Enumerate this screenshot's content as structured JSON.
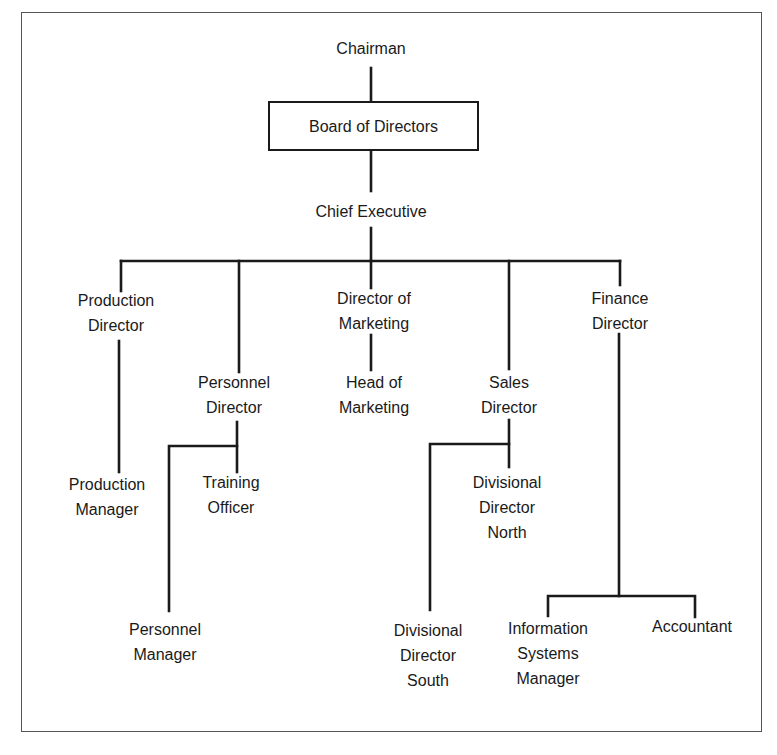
{
  "nodes": [
    {
      "id": "chairman",
      "lines": [
        "Chairman"
      ],
      "x": 371,
      "y": 36
    },
    {
      "id": "board",
      "lines": [
        "Board of Directors"
      ],
      "boxed": true,
      "x": 268,
      "y": 101,
      "w": 211,
      "h": 50
    },
    {
      "id": "chief_exec",
      "lines": [
        "Chief Executive"
      ],
      "x": 371,
      "y": 199
    },
    {
      "id": "production_director",
      "lines": [
        "Production",
        "Director"
      ],
      "x": 116,
      "y": 288
    },
    {
      "id": "personnel_director",
      "lines": [
        "Personnel",
        "Director"
      ],
      "x": 234,
      "y": 370
    },
    {
      "id": "director_marketing",
      "lines": [
        "Director of",
        "Marketing"
      ],
      "x": 374,
      "y": 286
    },
    {
      "id": "head_marketing",
      "lines": [
        "Head of",
        "Marketing"
      ],
      "x": 374,
      "y": 370
    },
    {
      "id": "sales_director",
      "lines": [
        "Sales",
        "Director"
      ],
      "x": 509,
      "y": 370
    },
    {
      "id": "finance_director",
      "lines": [
        "Finance",
        "Director"
      ],
      "x": 620,
      "y": 286
    },
    {
      "id": "production_manager",
      "lines": [
        "Production",
        "Manager"
      ],
      "x": 107,
      "y": 472
    },
    {
      "id": "training_officer",
      "lines": [
        "Training",
        "Officer"
      ],
      "x": 231,
      "y": 470
    },
    {
      "id": "personnel_manager",
      "lines": [
        "Personnel",
        "Manager"
      ],
      "x": 165,
      "y": 617
    },
    {
      "id": "div_director_north",
      "lines": [
        "Divisional",
        "Director",
        "North"
      ],
      "x": 507,
      "y": 470
    },
    {
      "id": "div_director_south",
      "lines": [
        "Divisional",
        "Director",
        "South"
      ],
      "x": 428,
      "y": 618
    },
    {
      "id": "is_manager",
      "lines": [
        "Information",
        "Systems",
        "Manager"
      ],
      "x": 548,
      "y": 616
    },
    {
      "id": "accountant",
      "lines": [
        "Accountant"
      ],
      "x": 692,
      "y": 614
    }
  ],
  "connectors": [
    {
      "from": "chairman",
      "to": "board",
      "points": [
        [
          371,
          68
        ],
        [
          371,
          101
        ]
      ]
    },
    {
      "from": "board",
      "to": "chief_exec",
      "points": [
        [
          371,
          151
        ],
        [
          371,
          191
        ]
      ]
    },
    {
      "from": "chief_exec",
      "to": "bar",
      "points": [
        [
          371,
          228
        ],
        [
          371,
          261
        ]
      ]
    },
    {
      "from": "bar",
      "to": "all_directors",
      "points": [
        [
          121,
          261
        ],
        [
          620,
          261
        ]
      ]
    },
    {
      "from": "bar",
      "to": "production_director",
      "points": [
        [
          121,
          261
        ],
        [
          121,
          291
        ]
      ]
    },
    {
      "from": "bar",
      "to": "personnel_director",
      "points": [
        [
          239,
          261
        ],
        [
          239,
          372
        ]
      ]
    },
    {
      "from": "bar",
      "to": "director_marketing",
      "points": [
        [
          371,
          261
        ],
        [
          371,
          288
        ]
      ]
    },
    {
      "from": "bar",
      "to": "sales_director",
      "points": [
        [
          509,
          261
        ],
        [
          509,
          369
        ]
      ]
    },
    {
      "from": "bar",
      "to": "finance_director",
      "points": [
        [
          620,
          261
        ],
        [
          620,
          285
        ]
      ]
    },
    {
      "from": "production_director",
      "to": "production_manager",
      "points": [
        [
          119,
          341
        ],
        [
          119,
          472
        ]
      ]
    },
    {
      "from": "director_marketing",
      "to": "head_marketing",
      "points": [
        [
          371,
          335
        ],
        [
          371,
          370
        ]
      ]
    },
    {
      "from": "personnel_director",
      "to": "training_officer",
      "points": [
        [
          237,
          422
        ],
        [
          237,
          472
        ]
      ]
    },
    {
      "from": "personnel_director",
      "to": "personnel_manager",
      "points": [
        [
          237,
          446
        ],
        [
          169,
          446
        ],
        [
          169,
          611
        ]
      ]
    },
    {
      "from": "sales_director",
      "to": "div_director_north",
      "points": [
        [
          509,
          420
        ],
        [
          509,
          467
        ]
      ]
    },
    {
      "from": "sales_director",
      "to": "div_director_south",
      "points": [
        [
          509,
          444
        ],
        [
          430,
          444
        ],
        [
          430,
          610
        ]
      ]
    },
    {
      "from": "finance_director",
      "to": "finance_split",
      "points": [
        [
          619,
          334
        ],
        [
          619,
          596
        ]
      ]
    },
    {
      "from": "finance_director",
      "to": "is_manager",
      "points": [
        [
          548,
          616
        ],
        [
          548,
          596
        ],
        [
          695,
          596
        ],
        [
          695,
          617
        ]
      ]
    }
  ],
  "style": {
    "line_color": "#1a1a1a",
    "text_color": "#1a1a1a",
    "frame_color": "#555555"
  }
}
